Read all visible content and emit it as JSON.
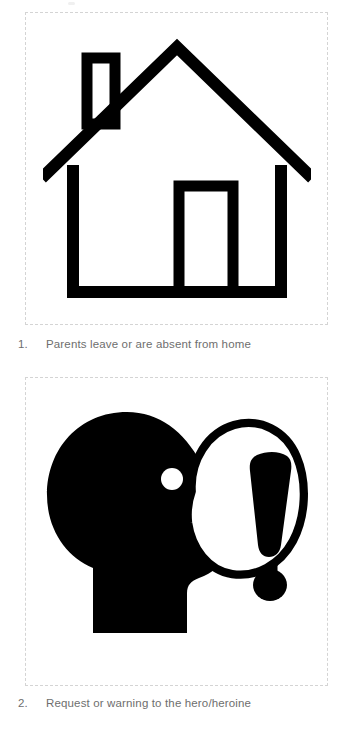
{
  "page": {
    "background_color": "#ffffff",
    "border_color": "#d4d4d4",
    "text_color": "#6e6e6e",
    "ink_color": "#000000"
  },
  "cards": [
    {
      "number": "1.",
      "caption": "Parents leave or are absent from home",
      "icon_name": "house-icon",
      "icon_description": "Outline drawing of a house with chimney and door"
    },
    {
      "number": "2.",
      "caption": "Request or warning to the hero/heroine",
      "icon_name": "speaking-head-icon",
      "icon_description": "Silhouette of a head in profile with an open mouth and a speech balloon containing an exclamation mark"
    }
  ]
}
